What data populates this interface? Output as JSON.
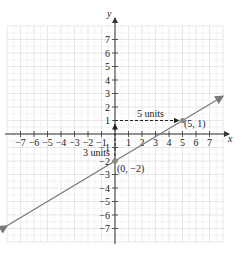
{
  "chart_data": {
    "type": "line",
    "title": "",
    "xlabel": "x",
    "ylabel": "y",
    "xlim": [
      -8,
      8
    ],
    "ylim": [
      -8,
      8
    ],
    "grid": true,
    "x_ticks": [
      -7,
      -6,
      -5,
      -4,
      -3,
      -2,
      -1,
      1,
      2,
      3,
      4,
      5,
      6,
      7
    ],
    "y_ticks": [
      -7,
      -6,
      -5,
      -4,
      -3,
      -2,
      -1,
      1,
      2,
      3,
      4,
      5,
      6,
      7
    ],
    "series": [
      {
        "name": "line",
        "equation": "y = (3/5)x - 2",
        "slope": 0.6,
        "intercept": -2,
        "x": [
          -8,
          8
        ],
        "y": [
          -6.8,
          2.8
        ],
        "color": "#7a7a7a"
      }
    ],
    "points": [
      {
        "x": 0,
        "y": -2,
        "label": "(0, −2)"
      },
      {
        "x": 5,
        "y": 1,
        "label": "(5, 1)"
      }
    ],
    "annotations": [
      {
        "type": "dashed-arrow",
        "from": [
          0,
          -2
        ],
        "to": [
          0,
          1
        ],
        "label": "3 units"
      },
      {
        "type": "dashed-arrow",
        "from": [
          0,
          1
        ],
        "to": [
          5,
          1
        ],
        "label": "5 units"
      }
    ]
  },
  "labels": {
    "x_axis": "x",
    "y_axis": "y",
    "rise": "3 units",
    "run": "5 units",
    "point_a": "(0, −2)",
    "point_b": "(5, 1)"
  },
  "colors": {
    "grid": "#dcdcdc",
    "axis": "#333333",
    "line": "#7a7a7a",
    "point": "#8a8a8a"
  }
}
